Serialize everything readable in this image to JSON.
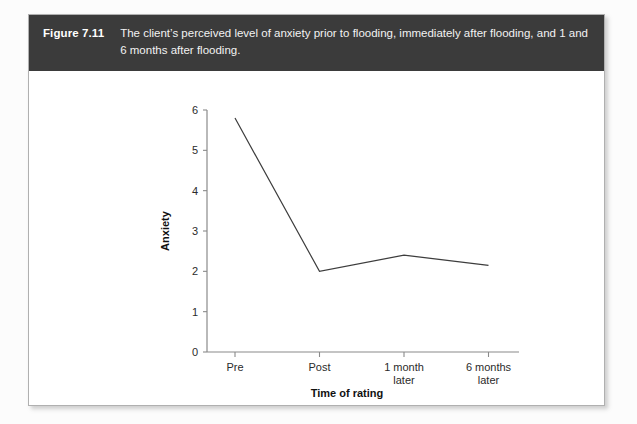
{
  "figure": {
    "number_label": "Figure 7.11",
    "caption_line1": "The client’s perceived level of anxiety prior to flooding, immediately after flooding, and",
    "caption_line2": "1 and 6 months after flooding.",
    "caption_full": "The client’s perceived level of anxiety prior to flooding, immediately after flooding, and 1 and 6 months after flooding.",
    "header_color": "#3b3b3b",
    "frame_border_color": "#b0b0b0"
  },
  "chart_data": {
    "type": "line",
    "title": "",
    "categories": [
      "Pre",
      "Post",
      "1 month later",
      "6 months later"
    ],
    "category_lines": [
      [
        "Pre"
      ],
      [
        "Post"
      ],
      [
        "1 month",
        "later"
      ],
      [
        "6 months",
        "later"
      ]
    ],
    "values": [
      5.8,
      2.0,
      2.4,
      2.15
    ],
    "series": [
      {
        "name": "Anxiety rating",
        "values": [
          5.8,
          2.0,
          2.4,
          2.15
        ]
      }
    ],
    "xlabel": "Time of rating",
    "ylabel": "Anxiety",
    "ylim": [
      0,
      6
    ],
    "yticks": [
      0,
      1,
      2,
      3,
      4,
      5,
      6
    ],
    "ytick_labels": [
      "0",
      "1",
      "2",
      "3",
      "4",
      "5",
      "6"
    ],
    "grid": false,
    "legend": false,
    "legend_position": "none",
    "markers": false,
    "line_color": "#3d3d3d",
    "axis_color": "#8a8a8a"
  }
}
